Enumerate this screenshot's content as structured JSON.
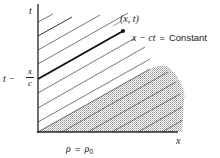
{
  "diagram": {
    "type": "characteristics-plot",
    "axes": {
      "vertical_label": "t",
      "horizontal_label": "x"
    },
    "point_label": "(x, t)",
    "characteristic_label": {
      "lhs": "x − ct",
      "eq": "=",
      "rhs": "Constant"
    },
    "intercept_label": {
      "prefix": "t −",
      "numerator": "x",
      "denominator": "c"
    },
    "region_label": {
      "lhs": "ρ",
      "eq": "=",
      "rhs": "ρ",
      "subscript": "0"
    },
    "colors": {
      "line": "#222222",
      "thin_line": "#555555",
      "shade": "#9a9a9a"
    }
  }
}
